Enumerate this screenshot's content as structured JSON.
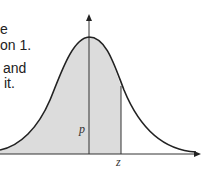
{
  "text_fragments": [
    {
      "id": "line1",
      "text": "e"
    },
    {
      "id": "line2",
      "text": "on 1."
    },
    {
      "id": "line3",
      "text": "and"
    },
    {
      "id": "line4",
      "text": "it."
    }
  ],
  "diagram": {
    "type": "normal-distribution-curve",
    "shaded_region": "area under curve left of z",
    "labels": {
      "area": "p",
      "x_marker": "z"
    },
    "colors": {
      "shade": "#dcdcdc",
      "curve": "#222222",
      "axis": "#333333"
    }
  }
}
